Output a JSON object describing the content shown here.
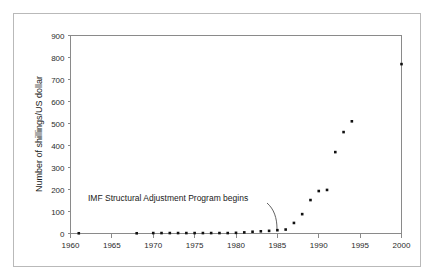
{
  "chart_data": {
    "type": "scatter",
    "title": "",
    "xlabel": "",
    "ylabel": "Number of shillings/US dollar",
    "xlim": [
      1960,
      2000
    ],
    "ylim": [
      0,
      900
    ],
    "xticks": [
      1960,
      1965,
      1970,
      1975,
      1980,
      1985,
      1990,
      1995,
      2000
    ],
    "yticks": [
      0,
      100,
      200,
      300,
      400,
      500,
      600,
      700,
      800,
      900
    ],
    "grid": false,
    "legend": null,
    "marker": "square",
    "marker_color": "#111111",
    "x": [
      1961,
      1968,
      1970,
      1971,
      1972,
      1973,
      1974,
      1975,
      1976,
      1977,
      1978,
      1979,
      1980,
      1981,
      1982,
      1983,
      1984,
      1985,
      1986,
      1987,
      1988,
      1989,
      1990,
      1991,
      1992,
      1993,
      1994,
      2000
    ],
    "values": [
      1,
      1,
      2,
      2,
      2,
      2,
      2,
      2,
      2,
      2,
      2,
      2,
      3,
      5,
      8,
      10,
      12,
      15,
      18,
      48,
      88,
      152,
      193,
      198,
      370,
      461,
      510,
      770
    ],
    "series": [
      {
        "name": "Shillings per US dollar",
        "points": [
          {
            "x": 1961,
            "y": 1
          },
          {
            "x": 1968,
            "y": 1
          },
          {
            "x": 1970,
            "y": 2
          },
          {
            "x": 1971,
            "y": 2
          },
          {
            "x": 1972,
            "y": 2
          },
          {
            "x": 1973,
            "y": 2
          },
          {
            "x": 1974,
            "y": 2
          },
          {
            "x": 1975,
            "y": 2
          },
          {
            "x": 1976,
            "y": 2
          },
          {
            "x": 1977,
            "y": 2
          },
          {
            "x": 1978,
            "y": 2
          },
          {
            "x": 1979,
            "y": 2
          },
          {
            "x": 1980,
            "y": 3
          },
          {
            "x": 1981,
            "y": 5
          },
          {
            "x": 1982,
            "y": 8
          },
          {
            "x": 1983,
            "y": 10
          },
          {
            "x": 1984,
            "y": 12
          },
          {
            "x": 1985,
            "y": 15
          },
          {
            "x": 1986,
            "y": 18
          },
          {
            "x": 1987,
            "y": 48
          },
          {
            "x": 1988,
            "y": 88
          },
          {
            "x": 1989,
            "y": 152
          },
          {
            "x": 1990,
            "y": 193
          },
          {
            "x": 1991,
            "y": 198
          },
          {
            "x": 1992,
            "y": 370
          },
          {
            "x": 1993,
            "y": 461
          },
          {
            "x": 1994,
            "y": 510
          },
          {
            "x": 2000,
            "y": 770
          }
        ]
      }
    ],
    "annotations": [
      {
        "text": "IMF Structural Adjustment Program begins",
        "points_to_x": 1986,
        "points_to_y": 18
      }
    ]
  }
}
